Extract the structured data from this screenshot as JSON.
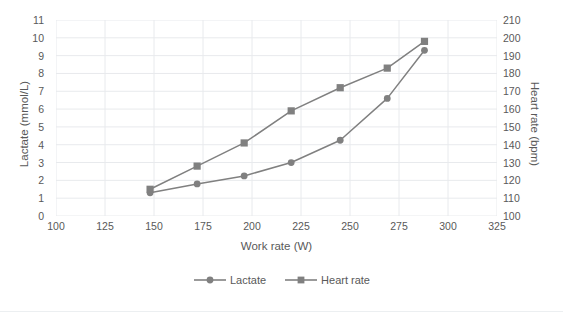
{
  "clipped_header": "",
  "chart_data": {
    "type": "line",
    "title": "",
    "xlabel": "Work rate (W)",
    "ylabel": "Lactate (mmol/L)",
    "y2label": "Heart rate (bpm)",
    "xlim": [
      100,
      325
    ],
    "xticks": [
      100,
      125,
      150,
      175,
      200,
      225,
      250,
      275,
      300,
      325
    ],
    "ylim": [
      0,
      11
    ],
    "yticks": [
      0,
      1,
      2,
      3,
      4,
      5,
      6,
      7,
      8,
      9,
      10,
      11
    ],
    "y2lim": [
      100,
      210
    ],
    "y2ticks": [
      100,
      110,
      120,
      130,
      140,
      150,
      160,
      170,
      180,
      190,
      200,
      210
    ],
    "grid": true,
    "legend_position": "bottom",
    "x": [
      148,
      172,
      196,
      220,
      245,
      269,
      288
    ],
    "series": [
      {
        "name": "Lactate",
        "axis": "left",
        "marker": "circle",
        "color": "#808080",
        "values": [
          1.3,
          1.8,
          2.25,
          3.0,
          4.25,
          6.6,
          9.3
        ]
      },
      {
        "name": "Heart rate",
        "axis": "right",
        "marker": "square",
        "color": "#808080",
        "values": [
          115,
          128,
          141,
          159,
          172,
          183,
          198
        ]
      }
    ]
  },
  "legend": {
    "items": [
      {
        "label": "Lactate",
        "marker": "circle-marker-icon"
      },
      {
        "label": "Heart rate",
        "marker": "square-marker-icon"
      }
    ]
  },
  "colors": {
    "series": "#808080",
    "grid": "#e8eaed",
    "text": "#595959",
    "background": "#ffffff"
  }
}
